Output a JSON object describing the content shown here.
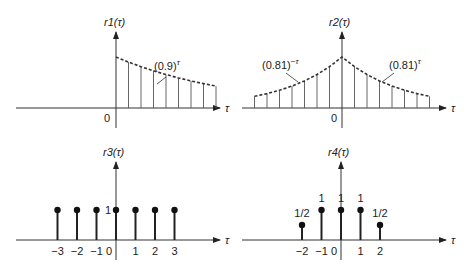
{
  "chart_data": [
    {
      "id": "r1",
      "type": "stem",
      "title": "r1(τ)",
      "xlabel": "τ",
      "annotation": "(0.9)^τ",
      "annotation_text": "(0.9)",
      "annotation_exp": "τ",
      "origin_label": "0",
      "envelope": "dashed",
      "x": [
        0,
        1,
        2,
        3,
        4,
        5,
        6,
        7,
        8
      ],
      "values": [
        1.0,
        0.9,
        0.81,
        0.729,
        0.656,
        0.59,
        0.531,
        0.478,
        0.43
      ]
    },
    {
      "id": "r2",
      "type": "stem",
      "title": "r2(τ)",
      "xlabel": "τ",
      "annotation_left": "(0.81)^-τ",
      "annotation_left_text": "(0.81)",
      "annotation_left_exp": "−τ",
      "annotation_right": "(0.81)^τ",
      "annotation_right_text": "(0.81)",
      "annotation_right_exp": "τ",
      "origin_label": "0",
      "envelope": "dashed",
      "x": [
        -7,
        -6,
        -5,
        -4,
        -3,
        -2,
        -1,
        0,
        1,
        2,
        3,
        4,
        5,
        6,
        7
      ],
      "values": [
        0.229,
        0.282,
        0.349,
        0.43,
        0.531,
        0.656,
        0.81,
        1.0,
        0.81,
        0.656,
        0.531,
        0.43,
        0.349,
        0.282,
        0.229
      ]
    },
    {
      "id": "r3",
      "type": "stem",
      "title": "r3(τ)",
      "xlabel": "τ",
      "value_label": "1",
      "x": [
        -3,
        -2,
        -1,
        0,
        1,
        2,
        3
      ],
      "tick_labels": [
        "−3",
        "−2",
        "−1",
        "0",
        "1",
        "2",
        "3"
      ],
      "values": [
        1,
        1,
        1,
        1,
        1,
        1,
        1
      ]
    },
    {
      "id": "r4",
      "type": "stem",
      "title": "r4(τ)",
      "xlabel": "τ",
      "x": [
        -2,
        -1,
        0,
        1,
        2
      ],
      "tick_labels": [
        "−2",
        "−1",
        "0",
        "1",
        "2"
      ],
      "values": [
        0.5,
        1,
        1,
        1,
        0.5
      ],
      "value_labels": [
        "1/2",
        "1",
        "1",
        "1",
        "1/2"
      ]
    }
  ]
}
